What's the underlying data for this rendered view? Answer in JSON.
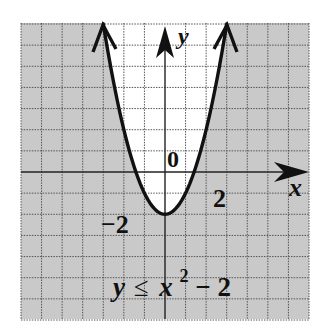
{
  "figure": {
    "inequality": {
      "lhs": "y",
      "symbol": "≤",
      "base": "x",
      "exponent": "2",
      "rest": "− 2"
    },
    "axes": {
      "x_label": "x",
      "y_label": "y",
      "origin_label": "0",
      "x_tick_label": "2",
      "y_tick_label": "−2"
    },
    "grid": {
      "x_range": [
        -7,
        7
      ],
      "y_range": [
        -7,
        7
      ],
      "unit_px": 21.14,
      "style": "dotted"
    },
    "curve": {
      "equation": "y = x^2 - 2",
      "vertex": [
        0,
        -2
      ],
      "boundary": "solid",
      "shaded_region": "below the parabola (y ≤ x² − 2)"
    },
    "colors": {
      "shaded": "#c9c9c9",
      "unshaded": "#ffffff",
      "curve": "#111111",
      "grid": "#555555",
      "axis": "#222222"
    }
  }
}
